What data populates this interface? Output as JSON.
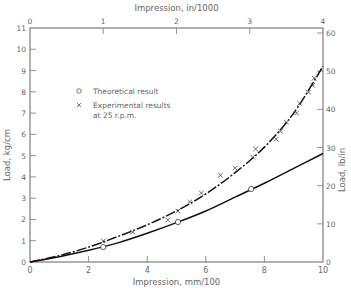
{
  "chart_data": {
    "type": "line",
    "title": "",
    "xlabel": "Impression,     mm/100",
    "xlabel_top": "Impression,     in/1000",
    "ylabel": "Load,     kg/cm",
    "ylabel_right": "Load,     lb/in",
    "xlim": [
      0,
      10
    ],
    "ylim": [
      0,
      11
    ],
    "xlim_top": [
      0,
      4
    ],
    "ylim_right": [
      0,
      60
    ],
    "x_ticks": [
      0,
      2,
      4,
      6,
      8,
      10
    ],
    "x_ticks_top": [
      0,
      1,
      2,
      3,
      4
    ],
    "y_ticks": [
      0,
      1,
      2,
      3,
      4,
      5,
      6,
      7,
      8,
      9,
      10,
      11
    ],
    "y_ticks_right": [
      0,
      10,
      20,
      30,
      40,
      50,
      60
    ],
    "grid": false,
    "legend": {
      "position": "upper-left",
      "entries": [
        {
          "marker": "o",
          "label": "Theoretical result"
        },
        {
          "marker": "x",
          "label": "Experimental results",
          "label_line2": "at 25 r.p.m."
        }
      ]
    },
    "series": [
      {
        "name": "Theoretical result",
        "marker": "o",
        "line_style": "solid",
        "points": [
          [
            2.5,
            0.7
          ],
          [
            5.05,
            1.88
          ],
          [
            7.55,
            3.43
          ]
        ],
        "curve": [
          [
            0,
            0
          ],
          [
            1,
            0.25
          ],
          [
            2,
            0.55
          ],
          [
            3,
            0.9
          ],
          [
            4,
            1.35
          ],
          [
            5,
            1.85
          ],
          [
            6,
            2.4
          ],
          [
            7,
            3.05
          ],
          [
            8,
            3.7
          ],
          [
            9,
            4.4
          ],
          [
            10,
            5.1
          ]
        ]
      },
      {
        "name": "Experimental results at 25 r.p.m.",
        "marker": "x",
        "line_style": "dash-dot",
        "points": [
          [
            2.5,
            0.99
          ],
          [
            3.5,
            1.41
          ],
          [
            4.7,
            1.97
          ],
          [
            5.05,
            2.39
          ],
          [
            5.45,
            2.82
          ],
          [
            5.85,
            3.24
          ],
          [
            6.5,
            4.08
          ],
          [
            7.0,
            4.41
          ],
          [
            7.6,
            4.93
          ],
          [
            7.7,
            5.31
          ],
          [
            8.4,
            5.77
          ],
          [
            8.55,
            6.15
          ],
          [
            8.75,
            6.57
          ],
          [
            9.1,
            7.0
          ],
          [
            9.2,
            7.46
          ],
          [
            9.5,
            7.98
          ],
          [
            9.65,
            8.31
          ],
          [
            9.7,
            8.64
          ]
        ],
        "curve": [
          [
            0,
            0
          ],
          [
            1,
            0.3
          ],
          [
            2,
            0.7
          ],
          [
            3,
            1.2
          ],
          [
            4,
            1.75
          ],
          [
            5,
            2.4
          ],
          [
            6,
            3.2
          ],
          [
            7,
            4.2
          ],
          [
            8,
            5.4
          ],
          [
            9,
            7.0
          ],
          [
            10,
            9.2
          ]
        ]
      }
    ]
  }
}
